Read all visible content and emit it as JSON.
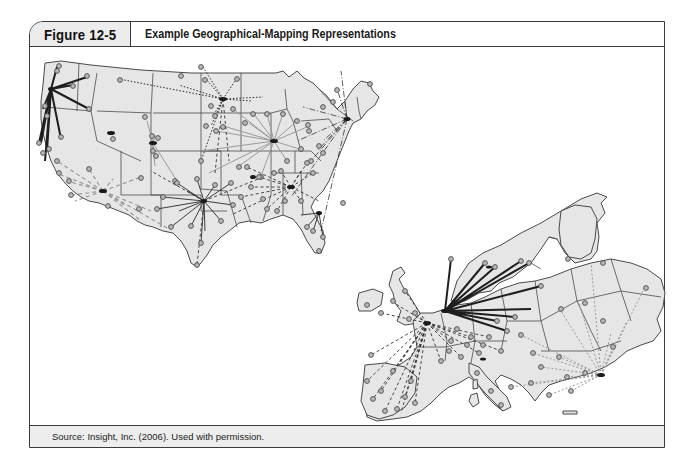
{
  "figure": {
    "label": "Figure 12-5",
    "title": "Example Geographical-Mapping Representations",
    "source": "Source: Insight, Inc. (2006). Used with permission."
  },
  "maps": [
    {
      "name": "United States",
      "description": "Hub-and-spoke network map of the continental United States",
      "hubs": [
        "Pacific Northwest",
        "Upper Midwest",
        "Chicago area",
        "Northeast / New York",
        "Texas",
        "Southeast / Atlanta",
        "Florida",
        "Southern California",
        "Colorado",
        "Utah"
      ],
      "link_styles": [
        "solid-dark",
        "solid-gray",
        "dotted",
        "dashed-gray",
        "dashed-dark",
        "dash-dot"
      ]
    },
    {
      "name": "Europe",
      "description": "Hub-and-spoke network map of Europe",
      "hubs": [
        "Belgium / Netherlands",
        "Paris",
        "Turkey / Eastern Mediterranean"
      ],
      "link_styles": [
        "solid-dark",
        "dashed-dark",
        "dotted-gray"
      ]
    }
  ],
  "colors": {
    "frame": "#3a3a3a",
    "land_fill": "#e6e6e6",
    "node_fill": "#b9b9b9",
    "hub": "#1a1a1a",
    "footer_bg": "#ededed",
    "label_bg": "#ececec"
  }
}
